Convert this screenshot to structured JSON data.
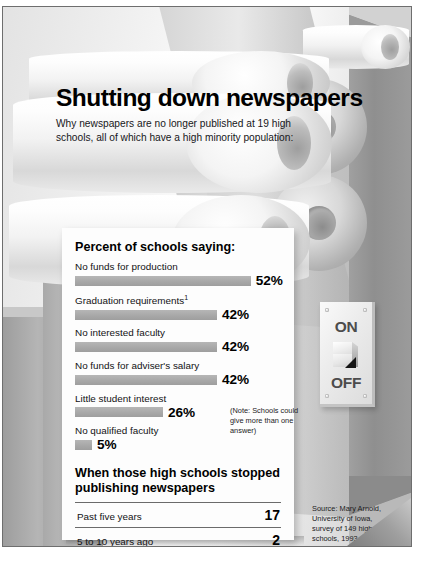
{
  "title": "Shutting down newspapers",
  "subtitle": "Why newspapers are no longer published at 19 high schools, all of which have a high minority population:",
  "section1": {
    "heading": "Percent of schools saying:",
    "note": "(Note: Schools could give more than one answer)"
  },
  "section2": {
    "heading": "When those high schools stopped publishing newspapers"
  },
  "footnote": "Journalism not a required course for graduation",
  "footnote_marker": "1",
  "source": "Source: Mary Arnold, University of Iowa, survey of 149 high schools, 1993",
  "switch": {
    "on_label": "ON",
    "off_label": "OFF"
  },
  "colors": {
    "bar": "#a8a8a8",
    "frame_border": "#6e6e6e",
    "card_background": "#fdfdfd",
    "text": "#000000",
    "switch_text": "#4c4c4c"
  },
  "chart_data": [
    {
      "type": "bar",
      "title": "Percent of schools saying:",
      "orientation": "horizontal",
      "xlabel": "",
      "ylabel": "",
      "xlim": [
        0,
        60
      ],
      "grid": false,
      "legend": "none",
      "unit": "%",
      "annotation": "(Note: Schools could give more than one answer)",
      "categories": [
        "No funds for production",
        "Graduation requirements",
        "No interested faculty",
        "No funds for adviser's salary",
        "Little student interest",
        "No qualified faculty"
      ],
      "values": [
        52,
        42,
        42,
        42,
        26,
        5
      ],
      "value_labels": [
        "52%",
        "42%",
        "42%",
        "42%",
        "26%",
        "5%"
      ],
      "category_footnote_markers": [
        "",
        "1",
        "",
        "",
        "",
        ""
      ]
    },
    {
      "type": "table",
      "title": "When those high schools stopped publishing newspapers",
      "categories": [
        "Past five years",
        "5 to 10 years ago"
      ],
      "values": [
        17,
        2
      ],
      "value_labels": [
        "17",
        "2"
      ],
      "unit": "schools"
    }
  ]
}
